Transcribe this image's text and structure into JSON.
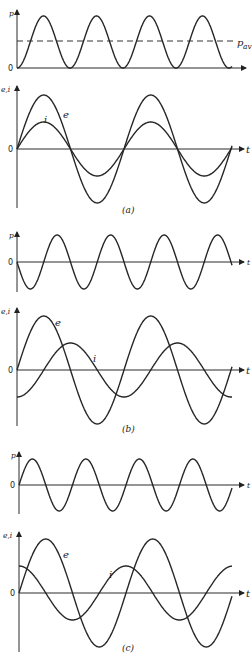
{
  "figure": {
    "panels": [
      {
        "id": "a",
        "caption": "(a)",
        "power_plot": {
          "y_label": "p",
          "x_label": "t",
          "origin_label": "0",
          "avg_label": "p",
          "avg_sub": "av",
          "axis_x": 17,
          "zero_y": 68,
          "top_y": 10,
          "x_end": 246,
          "avg_y": 41,
          "curve": {
            "kind": "sin2",
            "amp": 52,
            "period": 53,
            "phase": 0,
            "x0": 17,
            "x1": 232
          }
        },
        "ei_plot": {
          "y_label": "e,i",
          "x_label": "t",
          "origin_label": "0",
          "axis_x": 17,
          "zero_y": 149,
          "top_y": 86,
          "bottom_y": 208,
          "x_end": 244,
          "curves": [
            {
              "name": "e",
              "amp": 54,
              "period": 107,
              "phase": 0,
              "x0": 17,
              "x1": 232,
              "label_x": 63,
              "label_y": 118
            },
            {
              "name": "i",
              "amp": 27,
              "period": 107,
              "phase": 0,
              "x0": 17,
              "x1": 232,
              "label_x": 44,
              "label_y": 123
            }
          ]
        }
      },
      {
        "id": "b",
        "caption": "(b)",
        "power_plot": {
          "y_label": "p",
          "x_label": "t",
          "origin_label": "0",
          "axis_x": 17,
          "zero_y": 262,
          "top_y": 232,
          "bottom_y": 292,
          "x_end": 244,
          "curve": {
            "kind": "sin",
            "amp": 27,
            "period": 53.5,
            "phase": 180,
            "x0": 17,
            "x1": 232
          }
        },
        "ei_plot": {
          "y_label": "e,i",
          "x_label": "t",
          "origin_label": "0",
          "axis_x": 17,
          "zero_y": 370,
          "top_y": 308,
          "bottom_y": 426,
          "x_end": 244,
          "curves": [
            {
              "name": "e",
              "amp": 54,
              "period": 107,
              "phase": 0,
              "x0": 17,
              "x1": 232,
              "label_x": 55,
              "label_y": 326
            },
            {
              "name": "i",
              "amp": 27,
              "period": 107,
              "phase": -90,
              "x0": 17,
              "x1": 232,
              "label_x": 93,
              "label_y": 362
            }
          ]
        }
      },
      {
        "id": "c",
        "caption": "(c)",
        "power_plot": {
          "y_label": "p",
          "x_label": "t",
          "origin_label": "0",
          "axis_x": 19,
          "zero_y": 485,
          "top_y": 452,
          "bottom_y": 514,
          "x_end": 244,
          "curve": {
            "kind": "sin",
            "amp": 26,
            "period": 53.5,
            "phase": 0,
            "x0": 19,
            "x1": 232
          }
        },
        "ei_plot": {
          "y_label": "e,i",
          "x_label": "t",
          "origin_label": "0",
          "axis_x": 19,
          "zero_y": 593,
          "top_y": 532,
          "bottom_y": 652,
          "x_end": 244,
          "curves": [
            {
              "name": "e",
              "amp": 54,
              "period": 107,
              "phase": 0,
              "x0": 19,
              "x1": 232,
              "label_x": 63,
              "label_y": 558
            },
            {
              "name": "i",
              "amp": 27,
              "period": 107,
              "phase": 90,
              "x0": 19,
              "x1": 232,
              "label_x": 109,
              "label_y": 578
            }
          ]
        }
      }
    ],
    "caption_positions": {
      "a": [
        122,
        213
      ],
      "b": [
        122,
        432
      ],
      "c": [
        122,
        651
      ]
    }
  }
}
